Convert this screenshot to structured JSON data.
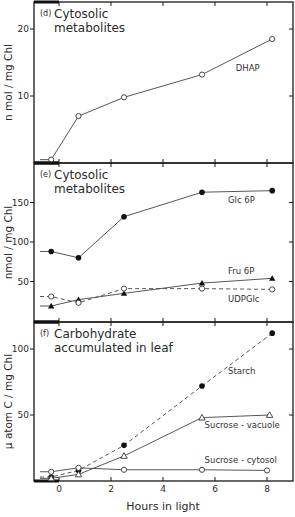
{
  "chart_data": [
    {
      "panel": "d",
      "type": "line",
      "title": "Cytosolic metabolites",
      "letter": "(d)",
      "xlabel": "",
      "ylabel": "n mol / mg Chl",
      "ylim": [
        0,
        24
      ],
      "yticks": [
        10,
        20
      ],
      "xlim": [
        -1,
        9
      ],
      "xticks": [
        0,
        2,
        4,
        6,
        8
      ],
      "series": [
        {
          "name": "DHAP",
          "marker": "open-circle",
          "dash": false,
          "lead_in_y": 0.5,
          "x": [
            -0.3,
            0.75,
            2.5,
            5.5,
            8.2
          ],
          "y": [
            0.5,
            7.0,
            9.8,
            13.2,
            18.5
          ],
          "label_pos": [
            6.8,
            13.8
          ]
        }
      ]
    },
    {
      "panel": "e",
      "type": "line",
      "title": "Cytosolic metabolites",
      "letter": "(e)",
      "xlabel": "",
      "ylabel": "nmol / mg Chl",
      "ylim": [
        0,
        200
      ],
      "yticks": [
        50,
        100,
        150
      ],
      "xlim": [
        -1,
        9
      ],
      "xticks": [
        0,
        2,
        4,
        6,
        8
      ],
      "series": [
        {
          "name": "Glc 6P",
          "marker": "filled-circle",
          "dash": false,
          "lead_in_y": 88,
          "x": [
            -0.3,
            0.75,
            2.5,
            5.5,
            8.2
          ],
          "y": [
            88,
            80,
            132,
            163,
            165
          ],
          "label_pos": [
            6.5,
            150
          ]
        },
        {
          "name": "Fru 6P",
          "marker": "filled-triangle",
          "dash": false,
          "lead_in_y": 19,
          "x": [
            -0.3,
            0.75,
            2.5,
            5.5,
            8.2
          ],
          "y": [
            19,
            27,
            35,
            48,
            54
          ],
          "label_pos": [
            6.5,
            59
          ]
        },
        {
          "name": "UDPGlc",
          "marker": "open-circle",
          "dash": true,
          "lead_in_y": 31,
          "x": [
            -0.3,
            0.75,
            2.5,
            5.5,
            8.2
          ],
          "y": [
            31,
            23,
            41,
            41,
            40
          ],
          "label_pos": [
            6.5,
            24
          ]
        }
      ]
    },
    {
      "panel": "f",
      "type": "line",
      "title": "Carbohydrate accumulated in leaf",
      "letter": "(f)",
      "xlabel": "Hours in light",
      "ylabel": "µ atom C / mg Chl",
      "ylim": [
        0,
        120
      ],
      "yticks": [
        50,
        100
      ],
      "xlim": [
        -1,
        9
      ],
      "xticks": [
        0,
        2,
        4,
        6,
        8
      ],
      "xticklabels": [
        "0",
        "2",
        "4",
        "6",
        "8"
      ],
      "series": [
        {
          "name": "Starch",
          "marker": "filled-circle",
          "dash": true,
          "lead_in_y": 3,
          "x": [
            -0.3,
            0.75,
            2.5,
            5.5,
            8.2
          ],
          "y": [
            3,
            8,
            27,
            72,
            112
          ],
          "label_pos": [
            6.5,
            81
          ]
        },
        {
          "name": "Sucrose-vacuole",
          "marker": "open-triangle",
          "dash": false,
          "lead_in_y": 2,
          "x": [
            -0.3,
            0.75,
            2.5,
            5.5,
            8.1
          ],
          "y": [
            2,
            5,
            19,
            48,
            50
          ],
          "label_pos": [
            5.6,
            40
          ]
        },
        {
          "name": "Sucrose-cytosol",
          "marker": "open-circle",
          "dash": false,
          "lead_in_y": 7,
          "x": [
            -0.3,
            0.75,
            2.5,
            5.5,
            8.0
          ],
          "y": [
            7,
            10,
            8.5,
            8.5,
            8
          ],
          "label_pos": [
            5.6,
            14
          ]
        }
      ]
    }
  ],
  "figure": {
    "xlabel": "Hours in light",
    "dark_period_bar": {
      "from": -1,
      "to": 0
    }
  }
}
